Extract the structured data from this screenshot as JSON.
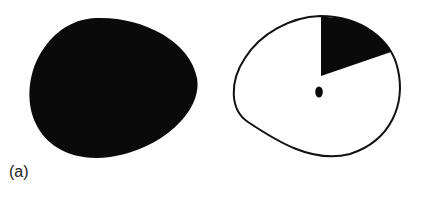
{
  "figure": {
    "panel_label": "(a)",
    "colors": {
      "fill_dark": "#0a0a0a",
      "background": "#ffffff",
      "outline": "#111111"
    },
    "shapes": [
      {
        "name": "solid-blob",
        "description": "fully filled black rounded blob"
      },
      {
        "name": "outlined-blob-with-wedge",
        "description": "outlined white blob with black pie wedge and center dot"
      }
    ]
  }
}
